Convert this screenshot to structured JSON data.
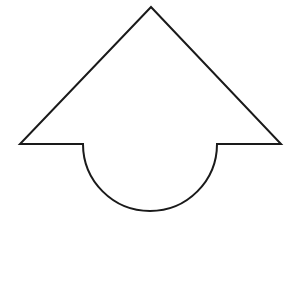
{
  "canvas": {
    "width": 300,
    "height": 287,
    "background_color": "#ffffff",
    "alt_description": "Black outline drawing of an upward-pointing arrow head whose shaft is a large circle"
  },
  "figure": {
    "name": "arrow-over-circle-outline",
    "type": "line-drawing",
    "fill_color": "#ffffff",
    "stroke_color": "#1a1a1a",
    "stroke_width": 2,
    "orientation": "up",
    "components": [
      {
        "name": "arrowhead-triangle",
        "type": "polygon",
        "apex": [
          151,
          7
        ],
        "left_wing_tip": [
          20,
          144
        ],
        "right_wing_tip": [
          281,
          144
        ],
        "left_shoulder_junction": [
          83,
          144
        ],
        "right_shoulder_junction": [
          217,
          144
        ],
        "shoulder_y": 144
      },
      {
        "name": "body-circle",
        "type": "circle",
        "center": [
          150,
          205
        ],
        "radius": 67,
        "top_y": 138,
        "bottom_y": 272,
        "left_x": 83,
        "right_x": 217,
        "visible_arc": "below-shoulder-line"
      }
    ],
    "path_d": "M 151 7 L 281 144 L 217 144 A 67 67 0 1 1 83 144 L 20 144 Z"
  }
}
